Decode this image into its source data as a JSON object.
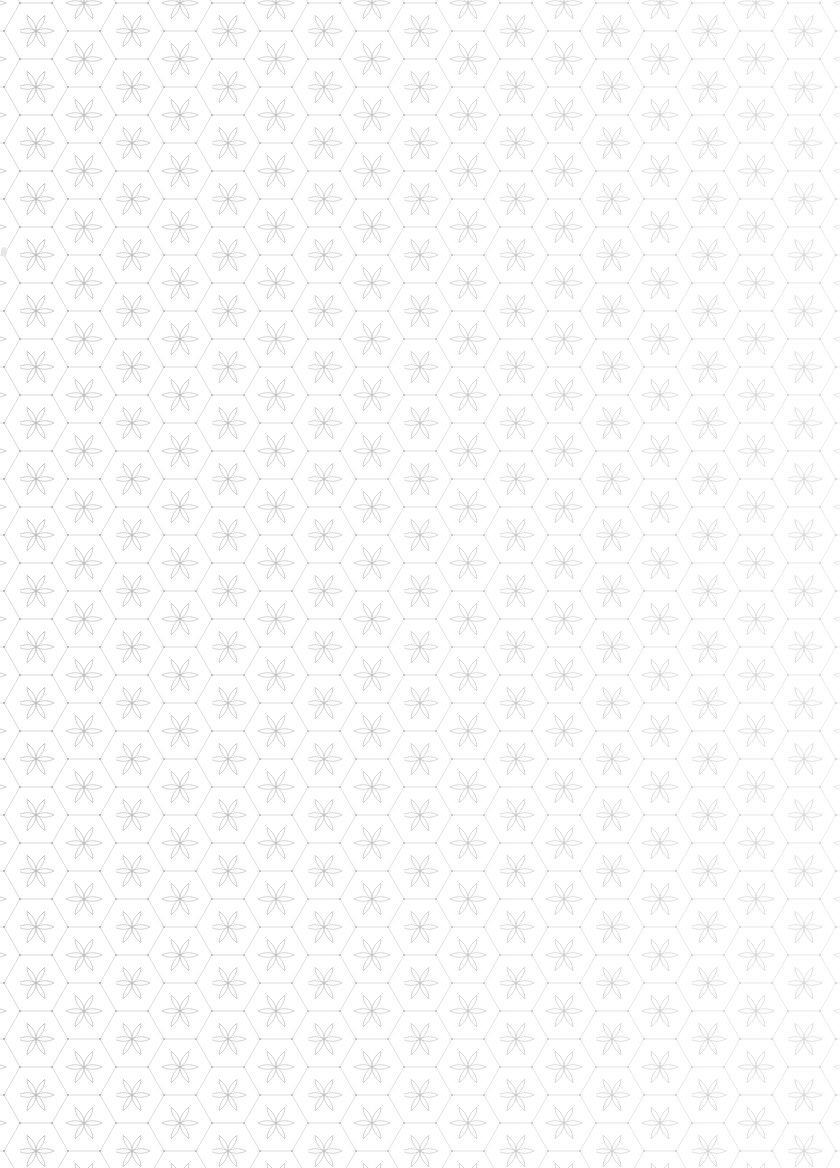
{
  "page": {
    "type": "patterned-paper",
    "text_content": ""
  },
  "pattern": {
    "period_x": 96,
    "period_y": 56,
    "line_color": "#c8c8c8",
    "petal_color": "#bdbdbd",
    "background": "#ffffff",
    "fade_direction": "right-lighter"
  }
}
